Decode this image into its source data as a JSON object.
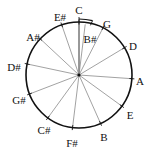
{
  "diagram": {
    "title": "",
    "center": {
      "x": 79,
      "y": 75
    },
    "radius": 53,
    "colors": {
      "ring": "#111111",
      "spoke": "#8a8a8a",
      "text": "#111111",
      "background": "#ffffff"
    },
    "notes": [
      {
        "label": "C",
        "angle": 0,
        "lx": 79,
        "ly": 11,
        "anchor": "middle"
      },
      {
        "label": "B#",
        "angle": 7,
        "lx": 90,
        "ly": 40,
        "anchor": "middle"
      },
      {
        "label": "G",
        "angle": 27,
        "lx": 107,
        "ly": 25,
        "anchor": "middle"
      },
      {
        "label": "D",
        "angle": 59,
        "lx": 133,
        "ly": 47,
        "anchor": "middle"
      },
      {
        "label": "A",
        "angle": 94,
        "lx": 140,
        "ly": 82,
        "anchor": "middle"
      },
      {
        "label": "E",
        "angle": 126,
        "lx": 130,
        "ly": 116,
        "anchor": "middle"
      },
      {
        "label": "B",
        "angle": 156,
        "lx": 104,
        "ly": 138,
        "anchor": "middle"
      },
      {
        "label": "F#",
        "angle": 187,
        "lx": 72,
        "ly": 144,
        "anchor": "middle"
      },
      {
        "label": "C#",
        "angle": 216,
        "lx": 44,
        "ly": 131,
        "anchor": "middle"
      },
      {
        "label": "G#",
        "angle": 249,
        "lx": 19,
        "ly": 101,
        "anchor": "middle"
      },
      {
        "label": "D#",
        "angle": 282,
        "lx": 14,
        "ly": 68,
        "anchor": "middle"
      },
      {
        "label": "A#",
        "angle": 313,
        "lx": 33,
        "ly": 38,
        "anchor": "middle"
      },
      {
        "label": "E#",
        "angle": 341,
        "lx": 60,
        "ly": 18,
        "anchor": "middle"
      }
    ],
    "comma_arc": {
      "label": "Pythagorean comma",
      "from_angle": 0,
      "to_angle": 14,
      "radius": 56
    }
  }
}
